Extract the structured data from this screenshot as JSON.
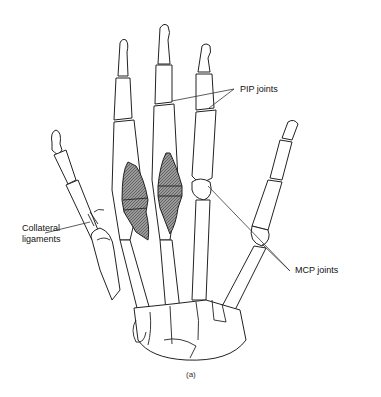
{
  "figure": {
    "caption": "(a)",
    "labels": {
      "pip": "PIP joints",
      "mcp": "MCP joints",
      "collateral_line1": "Collateral",
      "collateral_line2": "ligaments"
    },
    "colors": {
      "line": "#222222",
      "shade": "#7a7a7a",
      "background": "#ffffff"
    }
  }
}
